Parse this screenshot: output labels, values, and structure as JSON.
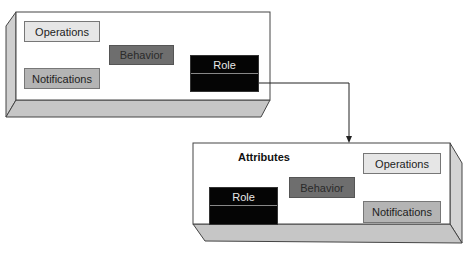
{
  "diagram": {
    "source_object": {
      "components": {
        "operations": "Operations",
        "behavior": "Behavior",
        "notifications": "Notifications",
        "role": "Role"
      }
    },
    "target_object": {
      "heading": "Attributes",
      "components": {
        "operations": "Operations",
        "behavior": "Behavior",
        "notifications": "Notifications",
        "role": "Role"
      }
    },
    "connector": {
      "from": "source_object.role",
      "to": "target_object",
      "style": "elbow-arrow"
    },
    "colors": {
      "box_face": "#ffffff",
      "box_side": "#c8c8c8",
      "operations_fill": "#e6e6e6",
      "notifications_fill": "#b4b4b4",
      "behavior_fill": "#6e6e6e",
      "role_fill": "#050505",
      "outline": "#444444"
    }
  }
}
